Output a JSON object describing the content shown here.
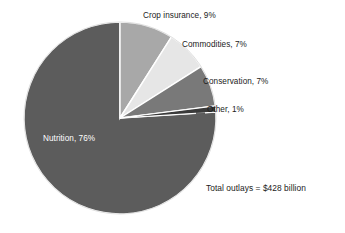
{
  "chart_data": {
    "type": "pie",
    "title": "",
    "subtitle": "",
    "xlabel": "",
    "ylabel": "",
    "units": "percent",
    "legend_position": "none",
    "grid": false,
    "start_angle_deg": 0,
    "direction": "clockwise",
    "categories": [
      "Crop insurance",
      "Commodities",
      "Conservation",
      "Other",
      "Nutrition"
    ],
    "values": [
      9,
      7,
      7,
      1,
      76
    ],
    "slices": [
      {
        "name": "crop-insurance",
        "label": "Crop insurance, 9%",
        "category": "Crop insurance",
        "value": 9,
        "value_text": "9%",
        "color": "#a8a8a8",
        "label_placement": "outside"
      },
      {
        "name": "commodities",
        "label": "Commodities, 7%",
        "category": "Commodities",
        "value": 7,
        "value_text": "7%",
        "color": "#e6e6e6",
        "label_placement": "outside"
      },
      {
        "name": "conservation",
        "label": "Conservation, 7%",
        "category": "Conservation",
        "value": 7,
        "value_text": "7%",
        "color": "#797979",
        "label_placement": "outside"
      },
      {
        "name": "other",
        "label": "Other, 1%",
        "category": "Other",
        "value": 1,
        "value_text": "1%",
        "color": "#3a3a3a",
        "label_placement": "outside-leader"
      },
      {
        "name": "nutrition",
        "label": "Nutrition, 76%",
        "category": "Nutrition",
        "value": 76,
        "value_text": "76%",
        "color": "#5c5c5c",
        "label_placement": "inside"
      }
    ],
    "annotations": [
      {
        "name": "total-outlays",
        "text": "Total outlays = $428 billion"
      }
    ],
    "total_text": "Total outlays = $428 billion",
    "total_value": 428,
    "total_units": "$ billion"
  },
  "figure": {
    "background_color": "#ffffff",
    "separator_color": "#ffffff",
    "text_color": "#1b1b1b",
    "inside_text_color": "#ffffff"
  }
}
